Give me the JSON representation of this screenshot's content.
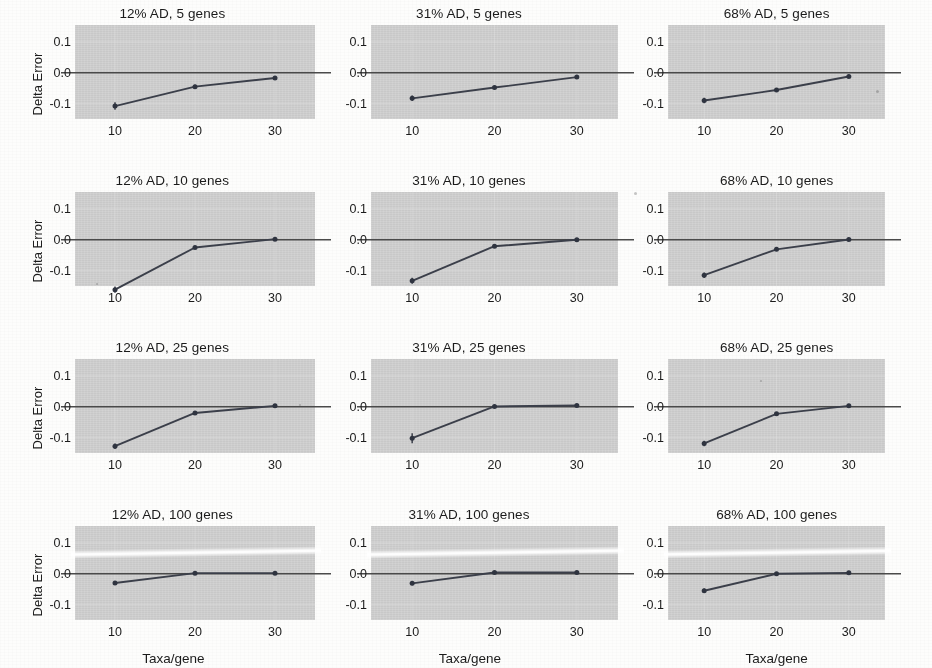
{
  "figure": {
    "panel_background_color": "#cfcfcf",
    "line_color": "#3b3f4a",
    "point_color": "#2f3440",
    "zero_line_color": "#4a4a4a",
    "y_axis_title": "Delta Error",
    "x_axis_title": "Taxa/gene",
    "y_tick_labels": [
      "0.1",
      "0.0",
      "-0.1"
    ],
    "y_tick_values": [
      0.1,
      0.0,
      -0.1
    ],
    "x_tick_labels": [
      "10",
      "20",
      "30"
    ],
    "x_tick_values": [
      10,
      20,
      30
    ],
    "columns": [
      "12% AD",
      "31% AD",
      "68% AD"
    ],
    "rows": [
      "5 genes",
      "10 genes",
      "25 genes",
      "100 genes"
    ]
  },
  "chart_data": [
    {
      "type": "line",
      "title": "12% AD, 5 genes",
      "xlabel": "Taxa/gene",
      "ylabel": "Delta Error",
      "x": [
        10,
        20,
        30
      ],
      "values": [
        -0.108,
        -0.045,
        -0.017
      ],
      "errors": [
        0.012,
        0.006,
        0.004
      ],
      "xlim": [
        5,
        35
      ],
      "ylim": [
        -0.15,
        0.155
      ],
      "grid": true,
      "legend": "none"
    },
    {
      "type": "line",
      "title": "31% AD, 5 genes",
      "xlabel": "Taxa/gene",
      "ylabel": "Delta Error",
      "x": [
        10,
        20,
        30
      ],
      "values": [
        -0.083,
        -0.048,
        -0.014
      ],
      "errors": [
        0.009,
        0.006,
        0.004
      ],
      "xlim": [
        5,
        35
      ],
      "ylim": [
        -0.15,
        0.155
      ],
      "grid": true,
      "legend": "none"
    },
    {
      "type": "line",
      "title": "68% AD, 5 genes",
      "xlabel": "Taxa/gene",
      "ylabel": "Delta Error",
      "x": [
        10,
        20,
        30
      ],
      "values": [
        -0.09,
        -0.056,
        -0.012
      ],
      "errors": [
        0.009,
        0.006,
        0.004
      ],
      "xlim": [
        5,
        35
      ],
      "ylim": [
        -0.15,
        0.155
      ],
      "grid": true,
      "legend": "none"
    },
    {
      "type": "line",
      "title": "12% AD, 10 genes",
      "xlabel": "Taxa/gene",
      "ylabel": "Delta Error",
      "x": [
        10,
        20,
        30
      ],
      "values": [
        -0.162,
        -0.025,
        0.002
      ],
      "errors": [
        0.01,
        0.005,
        0.003
      ],
      "xlim": [
        5,
        35
      ],
      "ylim": [
        -0.15,
        0.155
      ],
      "grid": true,
      "legend": "none"
    },
    {
      "type": "line",
      "title": "31% AD, 10 genes",
      "xlabel": "Taxa/gene",
      "ylabel": "Delta Error",
      "x": [
        10,
        20,
        30
      ],
      "values": [
        -0.133,
        -0.021,
        0.0
      ],
      "errors": [
        0.01,
        0.005,
        0.003
      ],
      "xlim": [
        5,
        35
      ],
      "ylim": [
        -0.15,
        0.155
      ],
      "grid": true,
      "legend": "none"
    },
    {
      "type": "line",
      "title": "68% AD, 10 genes",
      "xlabel": "Taxa/gene",
      "ylabel": "Delta Error",
      "x": [
        10,
        20,
        30
      ],
      "values": [
        -0.115,
        -0.031,
        0.001
      ],
      "errors": [
        0.009,
        0.005,
        0.003
      ],
      "xlim": [
        5,
        35
      ],
      "ylim": [
        -0.15,
        0.155
      ],
      "grid": true,
      "legend": "none"
    },
    {
      "type": "line",
      "title": "12% AD, 25 genes",
      "xlabel": "Taxa/gene",
      "ylabel": "Delta Error",
      "x": [
        10,
        20,
        30
      ],
      "values": [
        -0.128,
        -0.02,
        0.003
      ],
      "errors": [
        0.009,
        0.005,
        0.003
      ],
      "xlim": [
        5,
        35
      ],
      "ylim": [
        -0.15,
        0.155
      ],
      "grid": true,
      "legend": "none"
    },
    {
      "type": "line",
      "title": "31% AD, 25 genes",
      "xlabel": "Taxa/gene",
      "ylabel": "Delta Error",
      "x": [
        10,
        20,
        30
      ],
      "values": [
        -0.102,
        0.001,
        0.004
      ],
      "errors": [
        0.016,
        0.004,
        0.003
      ],
      "xlim": [
        5,
        35
      ],
      "ylim": [
        -0.15,
        0.155
      ],
      "grid": true,
      "legend": "none"
    },
    {
      "type": "line",
      "title": "68% AD, 25 genes",
      "xlabel": "Taxa/gene",
      "ylabel": "Delta Error",
      "x": [
        10,
        20,
        30
      ],
      "values": [
        -0.119,
        -0.023,
        0.003
      ],
      "errors": [
        0.009,
        0.005,
        0.003
      ],
      "xlim": [
        5,
        35
      ],
      "ylim": [
        -0.15,
        0.155
      ],
      "grid": true,
      "legend": "none"
    },
    {
      "type": "line",
      "title": "12% AD, 100 genes",
      "xlabel": "Taxa/gene",
      "ylabel": "Delta Error",
      "x": [
        10,
        20,
        30
      ],
      "values": [
        -0.03,
        0.002,
        0.002
      ],
      "errors": [
        0.006,
        0.003,
        0.003
      ],
      "xlim": [
        5,
        35
      ],
      "ylim": [
        -0.15,
        0.155
      ],
      "grid": true,
      "legend": "none"
    },
    {
      "type": "line",
      "title": "31% AD, 100 genes",
      "xlabel": "Taxa/gene",
      "ylabel": "Delta Error",
      "x": [
        10,
        20,
        30
      ],
      "values": [
        -0.031,
        0.004,
        0.004
      ],
      "errors": [
        0.006,
        0.003,
        0.003
      ],
      "xlim": [
        5,
        35
      ],
      "ylim": [
        -0.15,
        0.155
      ],
      "grid": true,
      "legend": "none"
    },
    {
      "type": "line",
      "title": "68% AD, 100 genes",
      "xlabel": "Taxa/gene",
      "ylabel": "Delta Error",
      "x": [
        10,
        20,
        30
      ],
      "values": [
        -0.055,
        0.0,
        0.003
      ],
      "errors": [
        0.007,
        0.003,
        0.003
      ],
      "xlim": [
        5,
        35
      ],
      "ylim": [
        -0.15,
        0.155
      ],
      "grid": true,
      "legend": "none"
    }
  ],
  "panels": [
    {
      "title": "12% AD, 5 genes",
      "col": 0,
      "row": 0,
      "show_y_title": true,
      "show_x_title": false
    },
    {
      "title": "31% AD, 5 genes",
      "col": 1,
      "row": 0,
      "show_y_title": false,
      "show_x_title": false
    },
    {
      "title": "68% AD, 5 genes",
      "col": 2,
      "row": 0,
      "show_y_title": false,
      "show_x_title": false
    },
    {
      "title": "12% AD, 10 genes",
      "col": 0,
      "row": 1,
      "show_y_title": true,
      "show_x_title": false
    },
    {
      "title": "31% AD, 10 genes",
      "col": 1,
      "row": 1,
      "show_y_title": false,
      "show_x_title": false
    },
    {
      "title": "68% AD, 10 genes",
      "col": 2,
      "row": 1,
      "show_y_title": false,
      "show_x_title": false
    },
    {
      "title": "12% AD, 25 genes",
      "col": 0,
      "row": 2,
      "show_y_title": true,
      "show_x_title": false
    },
    {
      "title": "31% AD, 25 genes",
      "col": 1,
      "row": 2,
      "show_y_title": false,
      "show_x_title": false
    },
    {
      "title": "68% AD, 25 genes",
      "col": 2,
      "row": 2,
      "show_y_title": false,
      "show_x_title": false
    },
    {
      "title": "12% AD, 100 genes",
      "col": 0,
      "row": 3,
      "show_y_title": true,
      "show_x_title": true
    },
    {
      "title": "31% AD, 100 genes",
      "col": 1,
      "row": 3,
      "show_y_title": false,
      "show_x_title": true
    },
    {
      "title": "68% AD, 100 genes",
      "col": 2,
      "row": 3,
      "show_y_title": false,
      "show_x_title": true
    }
  ]
}
